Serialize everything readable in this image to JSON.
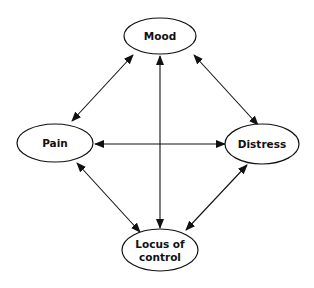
{
  "diagram": {
    "type": "relationship-graph",
    "colors": {
      "stroke": "#111111",
      "fill": "#ffffff",
      "text": "#111111",
      "background": "#ffffff"
    },
    "nodes": [
      {
        "id": "mood",
        "label": "Mood",
        "lines": [
          "Mood"
        ],
        "cx": 160,
        "cy": 36,
        "rx": 36,
        "ry": 18
      },
      {
        "id": "pain",
        "label": "Pain",
        "lines": [
          "Pain"
        ],
        "cx": 55,
        "cy": 143,
        "rx": 38,
        "ry": 19
      },
      {
        "id": "distress",
        "label": "Distress",
        "lines": [
          "Distress"
        ],
        "cx": 262,
        "cy": 144,
        "rx": 37,
        "ry": 20
      },
      {
        "id": "locus",
        "label": "Locus of control",
        "lines": [
          "Locus of",
          "control"
        ],
        "cx": 160,
        "cy": 250,
        "rx": 38,
        "ry": 21
      }
    ],
    "edges": [
      {
        "from": "pain",
        "to": "mood",
        "direction": "bidirectional",
        "x1": 72,
        "y1": 121,
        "x2": 133,
        "y2": 55
      },
      {
        "from": "mood",
        "to": "distress",
        "direction": "bidirectional",
        "x1": 194,
        "y1": 55,
        "x2": 258,
        "y2": 125
      },
      {
        "from": "pain",
        "to": "distress",
        "direction": "bidirectional",
        "x1": 95,
        "y1": 144,
        "x2": 225,
        "y2": 144
      },
      {
        "from": "mood",
        "to": "locus",
        "direction": "bidirectional",
        "x1": 160,
        "y1": 56,
        "x2": 160,
        "y2": 228
      },
      {
        "from": "pain",
        "to": "locus",
        "direction": "bidirectional",
        "x1": 77,
        "y1": 163,
        "x2": 140,
        "y2": 232
      },
      {
        "from": "distress",
        "to": "locus",
        "direction": "bidirectional",
        "x1": 247,
        "y1": 165,
        "x2": 186,
        "y2": 230
      }
    ]
  }
}
